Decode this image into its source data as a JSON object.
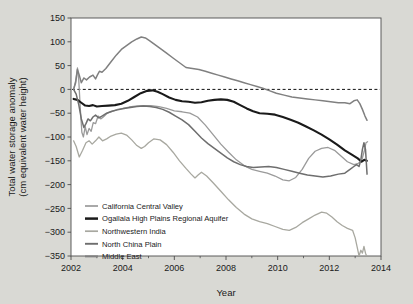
{
  "chart_data": {
    "type": "line",
    "title": "",
    "xlabel": "Year",
    "ylabel": "Total water storage anomaly\n(cm equivalent water height)",
    "ylabel_line1": "Total water storage anomaly",
    "ylabel_line2": "(cm equivalent water height)",
    "xlim": [
      2002,
      2014
    ],
    "ylim": [
      -350,
      150
    ],
    "xticks": [
      2002,
      2004,
      2006,
      2008,
      2010,
      2012,
      2014
    ],
    "xtick_labels": [
      "2002",
      "2004",
      "2006",
      "2008",
      "2010",
      "2012",
      "2014"
    ],
    "xminor_ticks": [
      2003,
      2005,
      2007,
      2009,
      2011,
      2013
    ],
    "yticks": [
      150,
      100,
      50,
      0,
      -50,
      -100,
      -150,
      -200,
      -250,
      -300,
      -350
    ],
    "ytick_labels": [
      "150",
      "100",
      "50",
      "0",
      "−50",
      "−100",
      "−150",
      "−200",
      "−250",
      "−300",
      "−350"
    ],
    "grid": false,
    "zero_line": {
      "value": 0,
      "style": "dashed",
      "color": "#111111"
    },
    "legend_position": "lower-left-inside",
    "plot_bg": "#ffffff",
    "page_bg": "#d9d9d4",
    "frame_color": "#4d4d4d",
    "series": [
      {
        "name": "California Central Valley",
        "color": "#9a9a9a",
        "width": 1.3,
        "points": [
          [
            2002.1,
            0
          ],
          [
            2002.18,
            18
          ],
          [
            2002.25,
            45
          ],
          [
            2002.3,
            20
          ],
          [
            2002.36,
            -40
          ],
          [
            2002.42,
            -90
          ],
          [
            2002.48,
            -100
          ],
          [
            2002.55,
            -78
          ],
          [
            2002.62,
            -95
          ],
          [
            2002.7,
            -82
          ],
          [
            2002.78,
            -88
          ],
          [
            2002.86,
            -70
          ],
          [
            2002.95,
            -72
          ],
          [
            2003.05,
            -56
          ],
          [
            2003.15,
            -62
          ],
          [
            2003.25,
            -58
          ],
          [
            2003.4,
            -50
          ],
          [
            2003.6,
            -46
          ],
          [
            2003.8,
            -42
          ],
          [
            2004.0,
            -40
          ],
          [
            2004.25,
            -37
          ],
          [
            2004.5,
            -35
          ],
          [
            2004.8,
            -34
          ],
          [
            2005.1,
            -34
          ],
          [
            2005.4,
            -36
          ],
          [
            2005.7,
            -40
          ],
          [
            2006.0,
            -45
          ],
          [
            2006.3,
            -47
          ],
          [
            2006.6,
            -50
          ],
          [
            2006.9,
            -58
          ],
          [
            2007.2,
            -75
          ],
          [
            2007.5,
            -95
          ],
          [
            2007.8,
            -115
          ],
          [
            2008.1,
            -132
          ],
          [
            2008.4,
            -148
          ],
          [
            2008.7,
            -160
          ],
          [
            2009.0,
            -168
          ],
          [
            2009.3,
            -172
          ],
          [
            2009.6,
            -176
          ],
          [
            2009.9,
            -182
          ],
          [
            2010.2,
            -190
          ],
          [
            2010.45,
            -192
          ],
          [
            2010.7,
            -185
          ],
          [
            2010.95,
            -168
          ],
          [
            2011.2,
            -145
          ],
          [
            2011.45,
            -130
          ],
          [
            2011.7,
            -124
          ],
          [
            2011.95,
            -122
          ],
          [
            2012.2,
            -128
          ],
          [
            2012.45,
            -140
          ],
          [
            2012.7,
            -152
          ],
          [
            2012.95,
            -158
          ],
          [
            2013.1,
            -156
          ],
          [
            2013.25,
            -150
          ],
          [
            2013.35,
            -130
          ],
          [
            2013.42,
            -112
          ],
          [
            2013.48,
            -110
          ]
        ]
      },
      {
        "name": "Ogallala High Plains Regional Aquifer",
        "color": "#1a1a1a",
        "width": 2.1,
        "points": [
          [
            2002.1,
            -20
          ],
          [
            2002.25,
            -22
          ],
          [
            2002.4,
            -28
          ],
          [
            2002.55,
            -34
          ],
          [
            2002.7,
            -35
          ],
          [
            2002.85,
            -33
          ],
          [
            2003.0,
            -36
          ],
          [
            2003.2,
            -35
          ],
          [
            2003.45,
            -34
          ],
          [
            2003.7,
            -33
          ],
          [
            2003.95,
            -30
          ],
          [
            2004.2,
            -24
          ],
          [
            2004.45,
            -16
          ],
          [
            2004.7,
            -8
          ],
          [
            2004.95,
            -3
          ],
          [
            2005.15,
            -2
          ],
          [
            2005.35,
            -5
          ],
          [
            2005.55,
            -10
          ],
          [
            2005.8,
            -17
          ],
          [
            2006.05,
            -22
          ],
          [
            2006.3,
            -25
          ],
          [
            2006.55,
            -26
          ],
          [
            2006.8,
            -28
          ],
          [
            2007.05,
            -27
          ],
          [
            2007.3,
            -24
          ],
          [
            2007.55,
            -22
          ],
          [
            2007.8,
            -21
          ],
          [
            2008.05,
            -22
          ],
          [
            2008.3,
            -26
          ],
          [
            2008.55,
            -33
          ],
          [
            2008.8,
            -40
          ],
          [
            2009.05,
            -46
          ],
          [
            2009.3,
            -50
          ],
          [
            2009.6,
            -51
          ],
          [
            2009.9,
            -53
          ],
          [
            2010.2,
            -58
          ],
          [
            2010.5,
            -64
          ],
          [
            2010.8,
            -70
          ],
          [
            2011.1,
            -78
          ],
          [
            2011.4,
            -86
          ],
          [
            2011.7,
            -95
          ],
          [
            2012.0,
            -105
          ],
          [
            2012.3,
            -116
          ],
          [
            2012.6,
            -128
          ],
          [
            2012.9,
            -138
          ],
          [
            2013.1,
            -145
          ],
          [
            2013.25,
            -152
          ],
          [
            2013.35,
            -148
          ],
          [
            2013.45,
            -150
          ]
        ]
      },
      {
        "name": "Northwestern India",
        "color": "#a8a8a0",
        "width": 1.3,
        "points": [
          [
            2002.1,
            -108
          ],
          [
            2002.2,
            -120
          ],
          [
            2002.32,
            -142
          ],
          [
            2002.45,
            -128
          ],
          [
            2002.58,
            -112
          ],
          [
            2002.7,
            -108
          ],
          [
            2002.82,
            -115
          ],
          [
            2002.95,
            -108
          ],
          [
            2003.08,
            -100
          ],
          [
            2003.22,
            -108
          ],
          [
            2003.38,
            -104
          ],
          [
            2003.55,
            -98
          ],
          [
            2003.75,
            -94
          ],
          [
            2003.95,
            -92
          ],
          [
            2004.15,
            -96
          ],
          [
            2004.35,
            -106
          ],
          [
            2004.55,
            -118
          ],
          [
            2004.72,
            -124
          ],
          [
            2004.85,
            -120
          ],
          [
            2005.0,
            -112
          ],
          [
            2005.2,
            -104
          ],
          [
            2005.45,
            -106
          ],
          [
            2005.7,
            -116
          ],
          [
            2005.95,
            -132
          ],
          [
            2006.2,
            -150
          ],
          [
            2006.45,
            -166
          ],
          [
            2006.65,
            -178
          ],
          [
            2006.8,
            -186
          ],
          [
            2006.92,
            -180
          ],
          [
            2007.05,
            -174
          ],
          [
            2007.25,
            -182
          ],
          [
            2007.5,
            -196
          ],
          [
            2007.8,
            -214
          ],
          [
            2008.1,
            -232
          ],
          [
            2008.4,
            -248
          ],
          [
            2008.7,
            -262
          ],
          [
            2009.0,
            -272
          ],
          [
            2009.3,
            -278
          ],
          [
            2009.6,
            -282
          ],
          [
            2009.9,
            -288
          ],
          [
            2010.2,
            -294
          ],
          [
            2010.45,
            -296
          ],
          [
            2010.7,
            -290
          ],
          [
            2010.95,
            -280
          ],
          [
            2011.2,
            -272
          ],
          [
            2011.45,
            -264
          ],
          [
            2011.7,
            -258
          ],
          [
            2011.9,
            -260
          ],
          [
            2012.1,
            -268
          ],
          [
            2012.3,
            -278
          ],
          [
            2012.5,
            -286
          ],
          [
            2012.7,
            -292
          ],
          [
            2012.9,
            -296
          ],
          [
            2013.0,
            -312
          ],
          [
            2013.08,
            -332
          ],
          [
            2013.15,
            -350
          ],
          [
            2013.22,
            -338
          ],
          [
            2013.28,
            -344
          ],
          [
            2013.34,
            -330
          ],
          [
            2013.4,
            -344
          ],
          [
            2013.46,
            -352
          ]
        ]
      },
      {
        "name": "North China Plain",
        "color": "#6e6e6e",
        "width": 1.5,
        "points": [
          [
            2002.1,
            0
          ],
          [
            2002.2,
            -10
          ],
          [
            2002.3,
            -32
          ],
          [
            2002.4,
            -62
          ],
          [
            2002.5,
            -80
          ],
          [
            2002.58,
            -72
          ],
          [
            2002.66,
            -62
          ],
          [
            2002.75,
            -66
          ],
          [
            2002.85,
            -58
          ],
          [
            2002.95,
            -54
          ],
          [
            2003.08,
            -60
          ],
          [
            2003.2,
            -56
          ],
          [
            2003.38,
            -50
          ],
          [
            2003.58,
            -46
          ],
          [
            2003.8,
            -43
          ],
          [
            2004.05,
            -40
          ],
          [
            2004.3,
            -38
          ],
          [
            2004.55,
            -36
          ],
          [
            2004.8,
            -35
          ],
          [
            2005.05,
            -36
          ],
          [
            2005.3,
            -38
          ],
          [
            2005.55,
            -42
          ],
          [
            2005.8,
            -48
          ],
          [
            2006.05,
            -56
          ],
          [
            2006.3,
            -64
          ],
          [
            2006.55,
            -74
          ],
          [
            2006.8,
            -88
          ],
          [
            2007.05,
            -102
          ],
          [
            2007.3,
            -114
          ],
          [
            2007.55,
            -124
          ],
          [
            2007.8,
            -134
          ],
          [
            2008.05,
            -144
          ],
          [
            2008.3,
            -152
          ],
          [
            2008.55,
            -158
          ],
          [
            2008.8,
            -162
          ],
          [
            2009.05,
            -164
          ],
          [
            2009.35,
            -163
          ],
          [
            2009.65,
            -162
          ],
          [
            2009.95,
            -164
          ],
          [
            2010.25,
            -168
          ],
          [
            2010.55,
            -172
          ],
          [
            2010.85,
            -176
          ],
          [
            2011.15,
            -180
          ],
          [
            2011.45,
            -182
          ],
          [
            2011.75,
            -184
          ],
          [
            2012.05,
            -182
          ],
          [
            2012.35,
            -178
          ],
          [
            2012.6,
            -176
          ],
          [
            2012.8,
            -168
          ],
          [
            2012.95,
            -162
          ],
          [
            2013.05,
            -158
          ],
          [
            2013.15,
            -162
          ],
          [
            2013.22,
            -148
          ],
          [
            2013.28,
            -126
          ],
          [
            2013.34,
            -112
          ],
          [
            2013.4,
            -126
          ],
          [
            2013.46,
            -178
          ]
        ]
      },
      {
        "name": "Middle East",
        "color": "#808080",
        "width": 1.5,
        "points": [
          [
            2002.1,
            0
          ],
          [
            2002.18,
            14
          ],
          [
            2002.25,
            42
          ],
          [
            2002.32,
            30
          ],
          [
            2002.4,
            14
          ],
          [
            2002.5,
            24
          ],
          [
            2002.6,
            20
          ],
          [
            2002.72,
            26
          ],
          [
            2002.85,
            30
          ],
          [
            2002.95,
            22
          ],
          [
            2003.02,
            30
          ],
          [
            2003.1,
            38
          ],
          [
            2003.2,
            36
          ],
          [
            2003.35,
            44
          ],
          [
            2003.55,
            58
          ],
          [
            2003.75,
            72
          ],
          [
            2003.95,
            84
          ],
          [
            2004.15,
            92
          ],
          [
            2004.35,
            100
          ],
          [
            2004.55,
            106
          ],
          [
            2004.72,
            110
          ],
          [
            2004.88,
            108
          ],
          [
            2005.05,
            102
          ],
          [
            2005.25,
            94
          ],
          [
            2005.45,
            86
          ],
          [
            2005.7,
            76
          ],
          [
            2005.95,
            66
          ],
          [
            2006.2,
            56
          ],
          [
            2006.45,
            46
          ],
          [
            2006.7,
            44
          ],
          [
            2006.95,
            42
          ],
          [
            2007.2,
            38
          ],
          [
            2007.45,
            34
          ],
          [
            2007.7,
            30
          ],
          [
            2007.95,
            26
          ],
          [
            2008.2,
            22
          ],
          [
            2008.45,
            18
          ],
          [
            2008.7,
            14
          ],
          [
            2008.95,
            10
          ],
          [
            2009.2,
            6
          ],
          [
            2009.45,
            2
          ],
          [
            2009.7,
            -3
          ],
          [
            2009.95,
            -8
          ],
          [
            2010.25,
            -12
          ],
          [
            2010.55,
            -16
          ],
          [
            2010.85,
            -18
          ],
          [
            2011.15,
            -20
          ],
          [
            2011.45,
            -22
          ],
          [
            2011.75,
            -24
          ],
          [
            2012.05,
            -26
          ],
          [
            2012.35,
            -28
          ],
          [
            2012.6,
            -28
          ],
          [
            2012.8,
            -30
          ],
          [
            2012.95,
            -24
          ],
          [
            2013.08,
            -22
          ],
          [
            2013.18,
            -30
          ],
          [
            2013.28,
            -42
          ],
          [
            2013.38,
            -56
          ],
          [
            2013.46,
            -65
          ]
        ]
      }
    ]
  }
}
